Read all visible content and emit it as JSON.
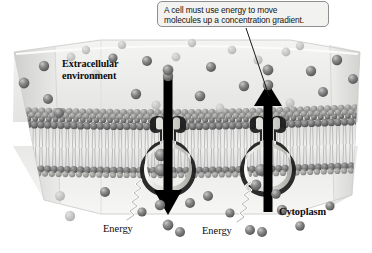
{
  "figure": {
    "type": "biology-diagram",
    "palette": {
      "background": "#ffffff",
      "callout_fill": "#f2f2f0",
      "callout_border": "#8e8e8e",
      "text": "#0d0d0d",
      "arrow": "#000000",
      "membrane_head_dark": "#6f6f6f",
      "membrane_head_light": "#b9b9b9",
      "membrane_tail": "#e4e4e2",
      "protein_fill": "#d6d6d2",
      "protein_outline": "#1a1a1a",
      "molecule_fill": "#707070",
      "slab_face": "#e9e9e7",
      "slab_side": "#dedede"
    }
  },
  "callout": {
    "line1": "A cell must use energy to move",
    "line2": "molecules up a concentration gradient.",
    "leader_from": [
      246,
      28
    ],
    "leader_to": [
      269,
      96
    ]
  },
  "labels": {
    "extracellular_line1": "Extracellular",
    "extracellular_line2": "environment",
    "cytoplasm": "Cytoplasm",
    "energy_left": "Energy",
    "energy_right": "Energy"
  },
  "arrows": [
    {
      "name": "downward-transport-arrow",
      "direction": "down",
      "from": [
        168,
        75
      ],
      "to": [
        168,
        212
      ],
      "meaning": "molecule moved into the cytoplasm"
    },
    {
      "name": "upward-transport-arrow",
      "direction": "up",
      "from": [
        268,
        212
      ],
      "to": [
        268,
        84
      ],
      "meaning": "molecule moved out to the extracellular environment"
    }
  ],
  "proteins": [
    {
      "name": "transport-protein-left",
      "x": 168,
      "y": 150
    },
    {
      "name": "transport-protein-right",
      "x": 268,
      "y": 150
    }
  ],
  "energy_squiggles": [
    {
      "name": "energy-squiggle-left",
      "x": 128,
      "y": 196
    },
    {
      "name": "energy-squiggle-right",
      "x": 238,
      "y": 198
    }
  ],
  "regions": {
    "above_membrane": "Extracellular environment",
    "below_membrane": "Cytoplasm",
    "membrane": "Phospholipid bilayer"
  }
}
